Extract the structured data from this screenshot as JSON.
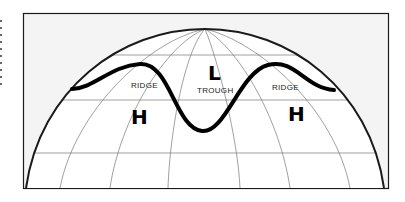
{
  "diagram": {
    "labels": {
      "ridge_left": "RIDGE",
      "ridge_right": "RIDGE",
      "trough": "TROUGH",
      "high_left": "H",
      "high_right": "H",
      "low": "L"
    },
    "colors": {
      "frame_bg": "#f4f4f4",
      "globe_fill": "#ffffff",
      "grid": "#777777",
      "outline": "#1a1a1a",
      "wave": "#000000"
    }
  }
}
